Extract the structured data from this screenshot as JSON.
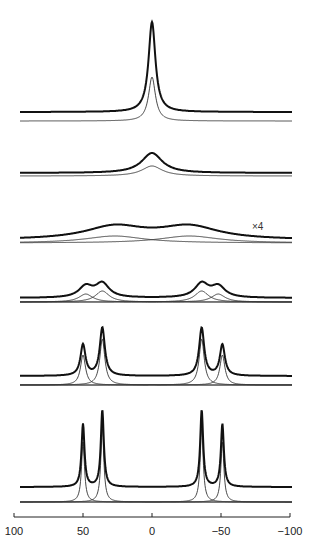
{
  "chart_data": {
    "type": "line",
    "title": "",
    "xlabel": "",
    "ylabel": "",
    "xlim": [
      100,
      -100
    ],
    "x_ticks": [
      100,
      50,
      0,
      -50,
      -100
    ],
    "x_tick_labels": [
      "100",
      "50",
      "0",
      "−50",
      "−100"
    ],
    "grid": false,
    "legend": "none",
    "annotation": "×4",
    "series": [
      {
        "name": "spectrum-1",
        "peaks": [
          {
            "pos": 0,
            "height": 90,
            "width": 3
          }
        ],
        "components": [
          {
            "pos": 0,
            "height": 44,
            "width": 3
          }
        ]
      },
      {
        "name": "spectrum-2",
        "peaks": [
          {
            "pos": 0,
            "height": 20,
            "width": 9
          }
        ],
        "components": [
          {
            "pos": 0,
            "height": 10,
            "width": 9
          }
        ]
      },
      {
        "name": "spectrum-3",
        "scale": "×4",
        "peaks": [
          {
            "pos": 27,
            "height": 13,
            "width": 26
          },
          {
            "pos": -27,
            "height": 13,
            "width": 26
          }
        ],
        "components": [
          {
            "pos": 27,
            "height": 7,
            "width": 26
          },
          {
            "pos": -27,
            "height": 7,
            "width": 26
          }
        ]
      },
      {
        "name": "spectrum-4",
        "peaks": [
          {
            "pos": 48,
            "height": 11,
            "width": 6
          },
          {
            "pos": 36,
            "height": 14,
            "width": 6
          },
          {
            "pos": -36,
            "height": 14,
            "width": 6
          },
          {
            "pos": -48,
            "height": 11,
            "width": 6
          }
        ],
        "components": [
          {
            "pos": 48,
            "height": 8,
            "width": 6
          },
          {
            "pos": 36,
            "height": 11,
            "width": 6
          },
          {
            "pos": -36,
            "height": 11,
            "width": 6
          },
          {
            "pos": -48,
            "height": 8,
            "width": 6
          }
        ]
      },
      {
        "name": "spectrum-5",
        "peaks": [
          {
            "pos": 50,
            "height": 31,
            "width": 2.2
          },
          {
            "pos": 36,
            "height": 48,
            "width": 2.2
          },
          {
            "pos": -36,
            "height": 48,
            "width": 2.2
          },
          {
            "pos": -51,
            "height": 31,
            "width": 2.2
          }
        ],
        "components": [
          {
            "pos": 50,
            "height": 30,
            "width": 2.2
          },
          {
            "pos": 36,
            "height": 46,
            "width": 2.2
          },
          {
            "pos": -36,
            "height": 46,
            "width": 2.2
          },
          {
            "pos": -51,
            "height": 30,
            "width": 2.2
          }
        ]
      },
      {
        "name": "spectrum-6",
        "peaks": [
          {
            "pos": 50,
            "height": 63,
            "width": 1.3
          },
          {
            "pos": 36,
            "height": 77,
            "width": 1.3
          },
          {
            "pos": -36,
            "height": 77,
            "width": 1.3
          },
          {
            "pos": -51,
            "height": 63,
            "width": 1.3
          }
        ],
        "components": [
          {
            "pos": 50,
            "height": 60,
            "width": 1.3
          },
          {
            "pos": 36,
            "height": 74,
            "width": 1.3
          },
          {
            "pos": -36,
            "height": 74,
            "width": 1.3
          },
          {
            "pos": -51,
            "height": 60,
            "width": 1.3
          }
        ]
      }
    ],
    "layout": {
      "x_px_at_100": 14,
      "x_px_at_minus100": 290,
      "curve_x_start": 20,
      "curve_x_end": 292,
      "baselines_thick": [
        112,
        173,
        240,
        298,
        376,
        487
      ],
      "baselines_thin": [
        121,
        176,
        243,
        302,
        385,
        502
      ],
      "axis_y": 517,
      "tick_label_y": 535,
      "annotation_pos": [
        252,
        230
      ]
    }
  }
}
